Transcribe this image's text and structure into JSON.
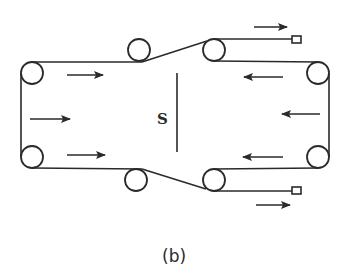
{
  "figure": {
    "caption": "(b)",
    "center_label": "S",
    "colors": {
      "line": "#2a2a2a",
      "background": "#ffffff"
    },
    "rollers": [
      {
        "name": "top-left",
        "cx": 32,
        "cy": 73,
        "r": 11
      },
      {
        "name": "bottom-left",
        "cx": 32,
        "cy": 157,
        "r": 11
      },
      {
        "name": "top-middle",
        "cx": 139,
        "cy": 50,
        "r": 11
      },
      {
        "name": "bottom-middle",
        "cx": 136,
        "cy": 180,
        "r": 11
      },
      {
        "name": "top-right-inner",
        "cx": 214,
        "cy": 50,
        "r": 11
      },
      {
        "name": "bottom-right-inner",
        "cx": 214,
        "cy": 180,
        "r": 11
      },
      {
        "name": "top-right",
        "cx": 318,
        "cy": 73,
        "r": 11
      },
      {
        "name": "bottom-right",
        "cx": 318,
        "cy": 157,
        "r": 11
      }
    ],
    "end_boxes": [
      {
        "name": "top-end-box",
        "x": 292,
        "y": 36,
        "w": 9,
        "h": 7
      },
      {
        "name": "bottom-end-box",
        "x": 292,
        "y": 187,
        "w": 9,
        "h": 7
      }
    ],
    "arrows": [
      {
        "name": "arrow-top-left-inner",
        "direction": "right",
        "x1": 67,
        "x2": 103,
        "y": 75
      },
      {
        "name": "arrow-left-middle",
        "direction": "right",
        "x1": 30,
        "x2": 70,
        "y": 119
      },
      {
        "name": "arrow-bottom-left-inner",
        "direction": "right",
        "x1": 67,
        "x2": 105,
        "y": 155
      },
      {
        "name": "arrow-top-outgoing",
        "direction": "right",
        "x1": 254,
        "x2": 287,
        "y": 27
      },
      {
        "name": "arrow-bottom-outgoing",
        "direction": "right",
        "x1": 256,
        "x2": 290,
        "y": 205
      },
      {
        "name": "arrow-top-right-inner",
        "direction": "left",
        "x1": 283,
        "x2": 244,
        "y": 77
      },
      {
        "name": "arrow-right-middle",
        "direction": "left",
        "x1": 320,
        "x2": 282,
        "y": 114
      },
      {
        "name": "arrow-bottom-right-inner",
        "direction": "left",
        "x1": 283,
        "x2": 243,
        "y": 157
      }
    ]
  }
}
